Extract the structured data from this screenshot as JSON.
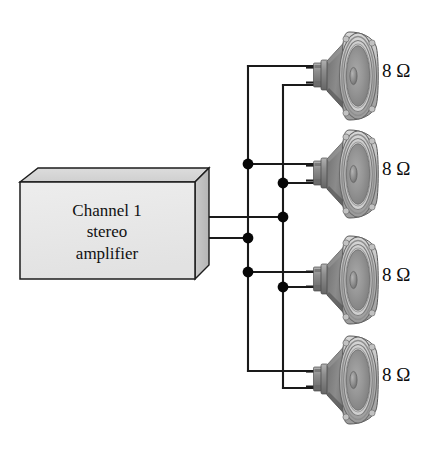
{
  "diagram": {
    "background_color": "#ffffff",
    "wire_color": "#1a1a1a",
    "junction_color": "#070707"
  },
  "amplifier": {
    "name": "amplifier-box",
    "line1": "Channel 1",
    "line2": "stereo",
    "line3": "amplifier",
    "face_color": "#e8e8e8",
    "top_color": "#d2d2d2",
    "side_color": "#c0c0c0",
    "edge_color": "#1c1c1c"
  },
  "speakers": [
    {
      "name": "speaker-1",
      "impedance": "8 Ω",
      "position": "top"
    },
    {
      "name": "speaker-2",
      "impedance": "8 Ω",
      "position": "upper-middle"
    },
    {
      "name": "speaker-3",
      "impedance": "8 Ω",
      "position": "lower-middle"
    },
    {
      "name": "speaker-4",
      "impedance": "8 Ω",
      "position": "bottom"
    }
  ],
  "bus": {
    "left_label": "left-bus-conductor",
    "right_label": "right-bus-conductor",
    "junction_count": 6
  }
}
